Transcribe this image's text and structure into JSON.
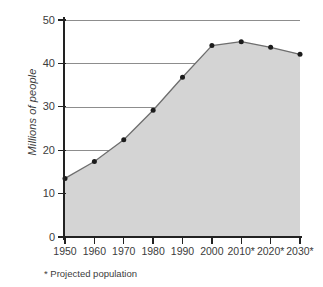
{
  "chart_data": {
    "type": "area",
    "title": "",
    "subtitle": "",
    "xlabel": "",
    "ylabel": "Millions of people",
    "categories": [
      "1950",
      "1960",
      "1970",
      "1980",
      "1990",
      "2000",
      "2010*",
      "2020*",
      "2030*"
    ],
    "x": [
      1950,
      1960,
      1970,
      1980,
      1990,
      2000,
      2010,
      2020,
      2030
    ],
    "values": [
      13.5,
      17.4,
      22.4,
      29.2,
      36.8,
      44.1,
      45.0,
      43.7,
      42.1
    ],
    "series": [
      {
        "name": "Population",
        "values": [
          13.5,
          17.4,
          22.4,
          29.2,
          36.8,
          44.1,
          45.0,
          43.7,
          42.1
        ]
      }
    ],
    "ylim": [
      0,
      50
    ],
    "yticks": [
      0,
      10,
      20,
      30,
      40,
      50
    ],
    "ytick_labels": [
      "0",
      "10",
      "20",
      "30",
      "40",
      "50"
    ],
    "grid": true,
    "legend": false,
    "legend_position": "none",
    "annotations": [
      "* Projected population"
    ],
    "colors": {
      "area_fill": "#d4d4d4",
      "line": "#6e6e6e",
      "marker": "#1c1c1c",
      "gridline": "#8d8d8d",
      "axis": "#222222",
      "text": "#3c3c3c",
      "background": "#ffffff"
    }
  },
  "footnote": {
    "text": "* Projected population"
  }
}
